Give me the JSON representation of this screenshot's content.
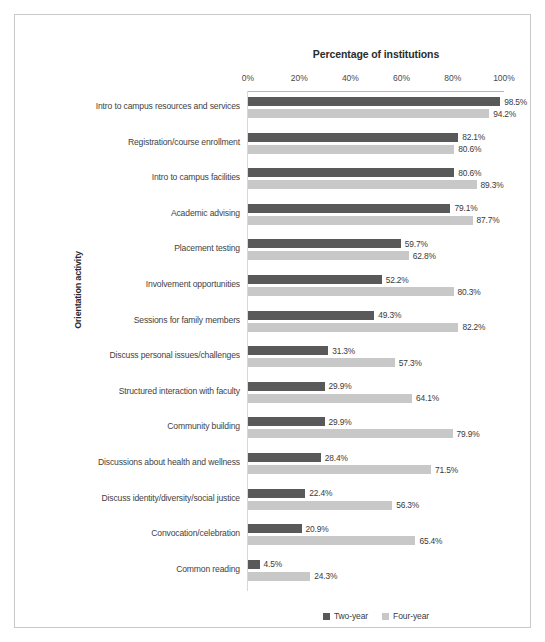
{
  "chart_data": {
    "type": "bar",
    "orientation": "horizontal",
    "title": "Percentage of institutions",
    "xlabel": "Percentage of institutions",
    "ylabel": "Orientation activity",
    "xlim": [
      0,
      100
    ],
    "xticks": [
      "0%",
      "20%",
      "40%",
      "60%",
      "80%",
      "100%"
    ],
    "xtick_values": [
      0,
      20,
      40,
      60,
      80,
      100
    ],
    "grid": false,
    "legend_position": "bottom",
    "categories": [
      "Intro to campus resources and services",
      "Registration/course enrollment",
      "Intro to campus facilities",
      "Academic advising",
      "Placement testing",
      "Involvement opportunities",
      "Sessions for family members",
      "Discuss personal issues/challenges",
      "Structured interaction with faculty",
      "Community building",
      "Discussions about health and wellness",
      "Discuss identity/diversity/social justice",
      "Convocation/celebration",
      "Common reading"
    ],
    "series": [
      {
        "name": "Two-year",
        "color": "#595959",
        "values": [
          98.5,
          82.1,
          80.6,
          79.1,
          59.7,
          52.2,
          49.3,
          31.3,
          29.9,
          29.9,
          28.4,
          22.4,
          20.9,
          4.5
        ],
        "labels": [
          "98.5%",
          "82.1%",
          "80.6%",
          "79.1%",
          "59.7%",
          "52.2%",
          "49.3%",
          "31.3%",
          "29.9%",
          "29.9%",
          "28.4%",
          "22.4%",
          "20.9%",
          "4.5%"
        ]
      },
      {
        "name": "Four-year",
        "color": "#c8c8c8",
        "values": [
          94.2,
          80.6,
          89.3,
          87.7,
          62.8,
          80.3,
          82.2,
          57.3,
          64.1,
          79.9,
          71.5,
          56.3,
          65.4,
          24.3
        ],
        "labels": [
          "94.2%",
          "80.6%",
          "89.3%",
          "87.7%",
          "62.8%",
          "80.3%",
          "82.2%",
          "57.3%",
          "64.1%",
          "79.9%",
          "71.5%",
          "56.3%",
          "65.4%",
          "24.3%"
        ]
      }
    ]
  },
  "legend": {
    "items": [
      {
        "label": "Two-year"
      },
      {
        "label": "Four-year"
      }
    ]
  }
}
